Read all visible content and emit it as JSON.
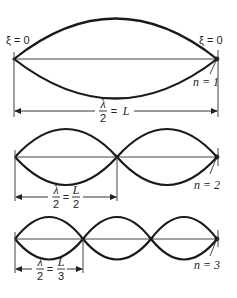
{
  "diagram": {
    "boundary_labels": {
      "left": "ξ = 0",
      "right": "ξ = 0"
    },
    "modes": [
      {
        "n_label": "n = 1",
        "loops": 1,
        "dimension": {
          "lhs_num": "λ",
          "lhs_den": "2",
          "equals": "=",
          "rhs_num": "L",
          "rhs_den": ""
        }
      },
      {
        "n_label": "n = 2",
        "loops": 2,
        "dimension": {
          "lhs_num": "λ",
          "lhs_den": "2",
          "equals": "=",
          "rhs_num": "L",
          "rhs_den": "2"
        }
      },
      {
        "n_label": "n = 3",
        "loops": 3,
        "dimension": {
          "lhs_num": "λ",
          "lhs_den": "2",
          "equals": "=",
          "rhs_num": "L",
          "rhs_den": "3"
        }
      }
    ],
    "colors": {
      "stroke": "#1a1a1a",
      "background": "#ffffff"
    }
  }
}
